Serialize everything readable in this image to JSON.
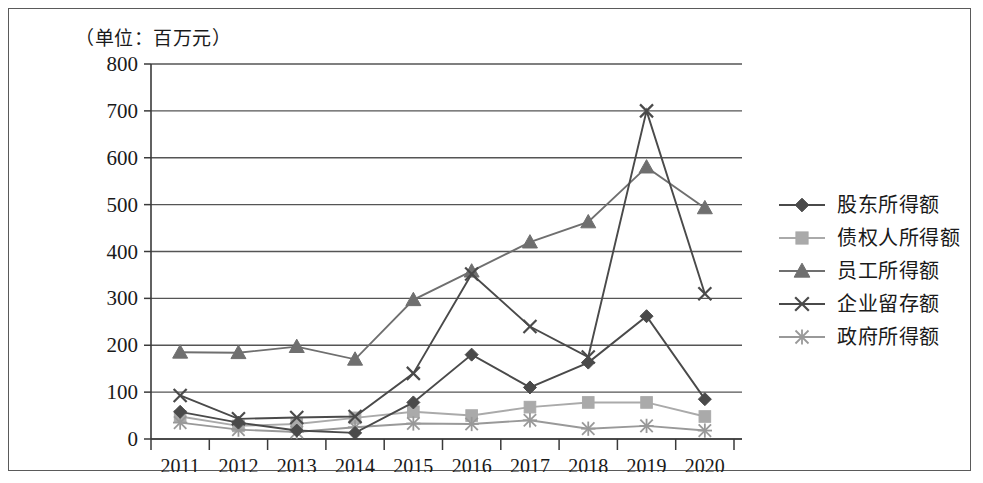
{
  "unit_label": "（单位：百万元）",
  "axis": {
    "y_ticks": [
      "0",
      "100",
      "200",
      "300",
      "400",
      "500",
      "600",
      "700",
      "800"
    ],
    "x_ticks": [
      "2011",
      "2012",
      "2013",
      "2014",
      "2015",
      "2016",
      "2017",
      "2018",
      "2019",
      "2020"
    ]
  },
  "legend": {
    "items": [
      {
        "label": "股东所得额",
        "marker": "diamond-marker",
        "color": "#4a4a4a"
      },
      {
        "label": "债权人所得额",
        "marker": "square-marker",
        "color": "#aaaaaa"
      },
      {
        "label": "员工所得额",
        "marker": "triangle-marker",
        "color": "#6f6f6f"
      },
      {
        "label": "企业留存额",
        "marker": "x-marker",
        "color": "#4a4a4a"
      },
      {
        "label": "政府所得额",
        "marker": "asterisk-marker",
        "color": "#999999"
      }
    ]
  },
  "chart_data": {
    "type": "line",
    "title": "（单位：百万元）",
    "xlabel": "",
    "ylabel": "百万元",
    "ylim": [
      0,
      800
    ],
    "ytick_step": 100,
    "grid": true,
    "legend_position": "right",
    "categories": [
      "2011",
      "2012",
      "2013",
      "2014",
      "2015",
      "2016",
      "2017",
      "2018",
      "2019",
      "2020"
    ],
    "series": [
      {
        "name": "股东所得额",
        "marker": "diamond",
        "color": "#4a4a4a",
        "values": [
          58,
          35,
          18,
          13,
          78,
          180,
          110,
          163,
          262,
          85
        ]
      },
      {
        "name": "债权人所得额",
        "marker": "square",
        "color": "#aaaaaa",
        "values": [
          48,
          28,
          32,
          45,
          58,
          50,
          68,
          78,
          78,
          48
        ]
      },
      {
        "name": "员工所得额",
        "marker": "triangle",
        "color": "#6f6f6f",
        "values": [
          185,
          184,
          197,
          170,
          297,
          358,
          420,
          463,
          580,
          493
        ]
      },
      {
        "name": "企业留存额",
        "marker": "x",
        "color": "#4a4a4a",
        "values": [
          93,
          43,
          46,
          48,
          140,
          352,
          240,
          175,
          700,
          310
        ]
      },
      {
        "name": "政府所得额",
        "marker": "asterisk",
        "color": "#999999",
        "values": [
          35,
          20,
          15,
          25,
          33,
          32,
          40,
          22,
          28,
          18
        ]
      }
    ]
  }
}
